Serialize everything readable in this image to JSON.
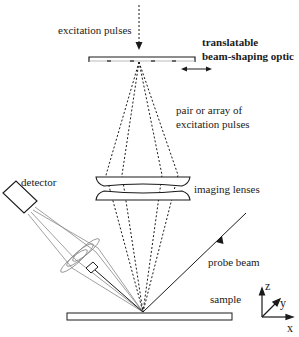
{
  "diagram": {
    "labels": {
      "excitation_pulses": "excitation pulses",
      "translatable_line1": "translatable",
      "translatable_line2": "beam-shaping optic",
      "pair_line1": "pair or array of",
      "pair_line2": "excitation pulses",
      "imaging_lenses": "imaging lenses",
      "detector": "detector",
      "probe_beam": "probe beam",
      "sample": "sample",
      "axis_z": "z",
      "axis_y": "y",
      "axis_x": "x"
    },
    "colors": {
      "ink": "#1a1a1a",
      "grey_ray": "#777777"
    }
  }
}
